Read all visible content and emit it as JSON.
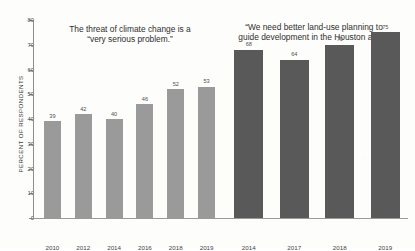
{
  "chart_data": {
    "type": "bar",
    "title": "",
    "xlabel": "",
    "ylabel": "PERCENT OF RESPONDENTS",
    "ylim": [
      0,
      80
    ],
    "yticks": [
      0,
      10,
      20,
      30,
      40,
      50,
      60,
      70,
      80
    ],
    "grid": false,
    "legend_position": "none",
    "groups": [
      {
        "caption": "The threat of climate change is a\n“very serious problem.”",
        "color": "#9a9a9a",
        "categories": [
          "2010",
          "2012",
          "2014",
          "2016",
          "2018",
          "2019"
        ],
        "values": [
          39,
          42,
          40,
          46,
          52,
          53
        ]
      },
      {
        "caption": "“We need better land-use planning to\nguide development in the Houston area.”",
        "color": "#595959",
        "categories": [
          "2014",
          "2017",
          "2018",
          "2019"
        ],
        "values": [
          68,
          64,
          70,
          75
        ]
      }
    ]
  },
  "axes": {
    "y_title": "PERCENT OF RESPONDENTS",
    "y_tick_labels": [
      "80",
      "70",
      "60",
      "50",
      "40",
      "30",
      "20",
      "10",
      "0"
    ]
  },
  "colors": {
    "light_bar": "#9a9a9a",
    "dark_bar": "#595959",
    "axis": "#8e8e8e",
    "text": "#3a3a3a",
    "background": "#fdfdfb"
  }
}
